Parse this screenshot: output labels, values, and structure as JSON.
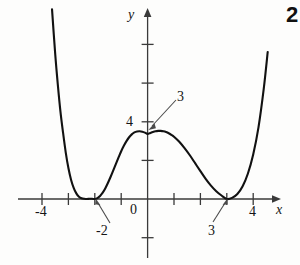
{
  "figure": {
    "problem_number": "2",
    "background_color": "#fdfdfc",
    "curve_color": "#111111",
    "axis_color": "#3a3a3a"
  },
  "axes": {
    "x_axis_label": "x",
    "y_axis_label": "y",
    "origin_label": "0",
    "x_ticks": [
      {
        "value": -4,
        "label": "-4"
      },
      {
        "value": -3,
        "label": ""
      },
      {
        "value": -2,
        "label": ""
      },
      {
        "value": -1,
        "label": ""
      },
      {
        "value": 1,
        "label": ""
      },
      {
        "value": 2,
        "label": ""
      },
      {
        "value": 3,
        "label": ""
      },
      {
        "value": 4,
        "label": "4"
      }
    ],
    "y_ticks": [
      {
        "value": 8,
        "label": ""
      },
      {
        "value": 6,
        "label": ""
      },
      {
        "value": 4,
        "label": "4"
      },
      {
        "value": 2,
        "label": ""
      },
      {
        "value": -2,
        "label": ""
      }
    ],
    "xlim": [
      -5.0,
      5.3
    ],
    "ylim": [
      -3.0,
      9.8
    ]
  },
  "callouts": [
    {
      "name": "y-intercept-callout",
      "label": "3",
      "points_to": "y-intercept of curve"
    },
    {
      "name": "left-root-callout",
      "label": "-2",
      "points_to": "left double root at x = -2"
    },
    {
      "name": "right-root-callout",
      "label": "3",
      "points_to": "right double root at x = 3"
    }
  ],
  "chart_data": {
    "type": "line",
    "title": "",
    "xlabel": "x",
    "ylabel": "y",
    "grid": false,
    "legend": null,
    "xlim": [
      -5.0,
      5.3
    ],
    "ylim": [
      -3.0,
      9.8
    ],
    "annotations": [
      {
        "text": "3",
        "x": 0,
        "y": 3.4,
        "note": "y-intercept"
      },
      {
        "text": "-2",
        "x": -2,
        "y": 0,
        "note": "double root / local minimum touching x-axis"
      },
      {
        "text": "3",
        "x": 3,
        "y": 0,
        "note": "double root / local minimum touching x-axis"
      }
    ],
    "series": [
      {
        "name": "quartic with double roots at x=-2 and x=3",
        "x": [
          -3.62,
          -3.5,
          -3.4,
          -3.3,
          -3.2,
          -3.1,
          -3.0,
          -2.9,
          -2.8,
          -2.7,
          -2.6,
          -2.5,
          -2.4,
          -2.3,
          -2.2,
          -2.1,
          -2.0,
          -1.9,
          -1.8,
          -1.7,
          -1.6,
          -1.5,
          -1.4,
          -1.3,
          -1.2,
          -1.1,
          -1.0,
          -0.9,
          -0.8,
          -0.7,
          -0.6,
          -0.5,
          -0.4,
          -0.3,
          -0.2,
          -0.1,
          0.0,
          0.1,
          0.2,
          0.3,
          0.4,
          0.5,
          0.6,
          0.7,
          0.8,
          0.9,
          1.0,
          1.2,
          1.4,
          1.6,
          1.8,
          2.0,
          2.2,
          2.4,
          2.6,
          2.8,
          3.0,
          3.2,
          3.4,
          3.6,
          3.8,
          4.0,
          4.2,
          4.4,
          4.55
        ],
        "y": [
          9.8,
          7.5,
          5.9,
          4.5,
          3.4,
          2.4,
          1.6,
          1.0,
          0.58,
          0.29,
          0.12,
          0.04,
          0.01,
          0.0,
          0.01,
          0.01,
          0.0,
          0.05,
          0.16,
          0.33,
          0.56,
          0.84,
          1.15,
          1.48,
          1.82,
          2.15,
          2.47,
          2.75,
          2.99,
          3.19,
          3.34,
          3.44,
          3.49,
          3.5,
          3.48,
          3.43,
          3.36,
          3.41,
          3.46,
          3.5,
          3.52,
          3.52,
          3.5,
          3.46,
          3.4,
          3.32,
          3.22,
          2.96,
          2.63,
          2.26,
          1.85,
          1.44,
          1.04,
          0.69,
          0.4,
          0.18,
          0.0,
          0.06,
          0.26,
          0.66,
          1.32,
          2.3,
          3.7,
          5.7,
          7.6
        ]
      }
    ]
  }
}
